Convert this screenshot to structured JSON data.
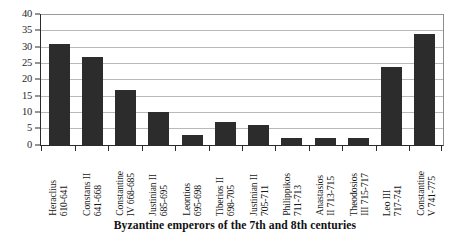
{
  "chart_data": {
    "type": "bar",
    "title": "Byzantine emperors of the 7th and 8th centuries",
    "xlabel": "",
    "ylabel": "",
    "ylim": [
      0,
      40
    ],
    "ytick_step": 5,
    "yticks": [
      "40",
      "35",
      "30",
      "25",
      "20",
      "15",
      "10",
      "5",
      "0"
    ],
    "grid": true,
    "legend": false,
    "bar_color": "#2c2c2c",
    "categories": [
      "Heraclius 610-641",
      "Constans II 641-668",
      "Constantine IV 668-685",
      "Justinian II 685-695",
      "Leontios 695-698",
      "Tiberios II 698-705",
      "Justinian II 705-711",
      "Philippikos 711-713",
      "Anastasios II 713-715",
      "Theodosios III 715-717",
      "Leo III 717-741",
      "Constantine V 741-775"
    ],
    "category_lines": [
      [
        "Heraclius",
        "610-641"
      ],
      [
        "Constans II",
        "641-668"
      ],
      [
        "Constantine",
        "IV 668-685"
      ],
      [
        "Justinian II",
        "685-695"
      ],
      [
        "Leontios",
        "695-698"
      ],
      [
        "Tiberios II",
        "698-705"
      ],
      [
        "Justinian II",
        "705-711"
      ],
      [
        "Philippikos",
        "711-713"
      ],
      [
        "Anastasios",
        "II 713-715"
      ],
      [
        "Theodosios",
        "III 715-717"
      ],
      [
        "Leo III",
        "717-741"
      ],
      [
        "Constantine",
        "V 741-775"
      ]
    ],
    "values": [
      31,
      27,
      17,
      10,
      3,
      7,
      6,
      2,
      2,
      2,
      24,
      34
    ]
  },
  "caption": {
    "text": "Byzantine emperors of the 7th and 8th centuries"
  }
}
